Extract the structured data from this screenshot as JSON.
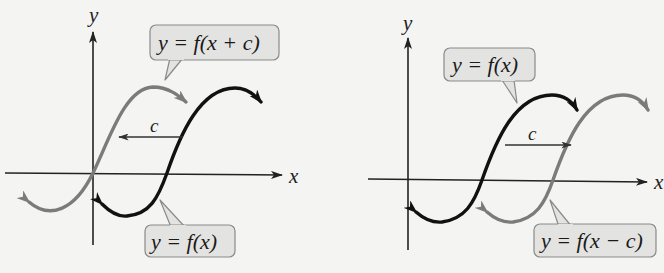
{
  "figure": {
    "colors": {
      "background": "#f4f4f2",
      "axis": "#222222",
      "original_curve": "#111111",
      "shifted_curve": "#7b7b7b",
      "callout_fill": "#e3e3e1",
      "callout_stroke": "#8a8a8a"
    },
    "panels": [
      {
        "id": "left-shift",
        "axis_labels": {
          "x": "x",
          "y": "y"
        },
        "shift_label": "c",
        "shift_direction": "left",
        "curves": [
          {
            "name": "shifted",
            "label": "y = f(x + c)",
            "style": "gray"
          },
          {
            "name": "original",
            "label": "y = f(x)",
            "style": "black"
          }
        ]
      },
      {
        "id": "right-shift",
        "axis_labels": {
          "x": "x",
          "y": "y"
        },
        "shift_label": "c",
        "shift_direction": "right",
        "curves": [
          {
            "name": "original",
            "label": "y = f(x)",
            "style": "black"
          },
          {
            "name": "shifted",
            "label": "y = f(x − c)",
            "style": "gray"
          }
        ]
      }
    ]
  }
}
